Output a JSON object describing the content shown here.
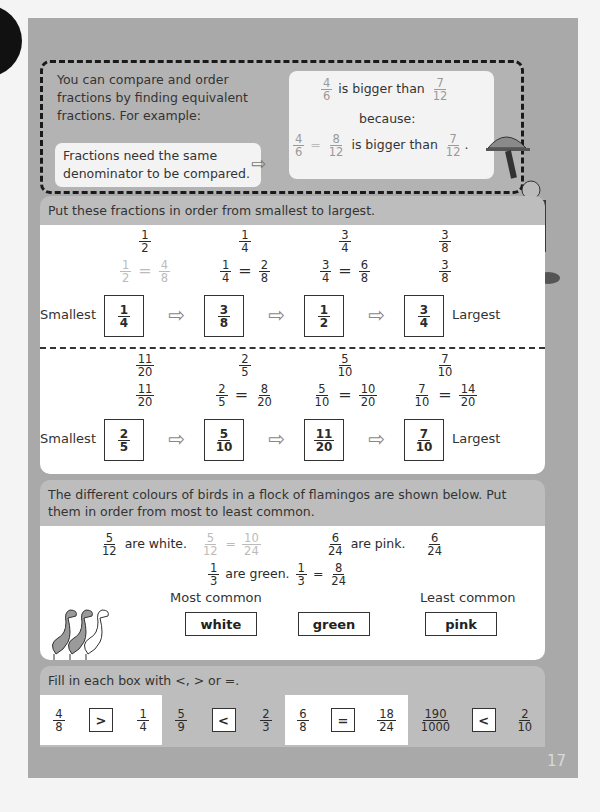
{
  "page_number": "17",
  "intro": {
    "text": "You can compare and order fractions by finding equivalent fractions.  For example:",
    "note": "Fractions need the same denominator to be compared.",
    "example": {
      "line1": {
        "a": {
          "n": "4",
          "d": "6"
        },
        "text": "is bigger than",
        "b": {
          "n": "7",
          "d": "12"
        }
      },
      "because": "because:",
      "line2": {
        "a": {
          "n": "4",
          "d": "6"
        },
        "eq": "=",
        "c": {
          "n": "8",
          "d": "12"
        },
        "text": "is bigger than",
        "b": {
          "n": "7",
          "d": "12"
        },
        "end": "."
      }
    }
  },
  "section1": {
    "header": "Put these fractions in order from smallest to largest.",
    "smallest_label": "Smallest",
    "largest_label": "Largest",
    "row1": {
      "given": [
        {
          "n": "1",
          "d": "2"
        },
        {
          "n": "1",
          "d": "4"
        },
        {
          "n": "3",
          "d": "4"
        },
        {
          "n": "3",
          "d": "8"
        }
      ],
      "working": [
        {
          "a": {
            "n": "1",
            "d": "2"
          },
          "eq": "=",
          "b": {
            "n": "4",
            "d": "8"
          }
        },
        {
          "a": {
            "n": "1",
            "d": "4"
          },
          "eq": "=",
          "b": {
            "n": "2",
            "d": "8"
          }
        },
        {
          "a": {
            "n": "3",
            "d": "4"
          },
          "eq": "=",
          "b": {
            "n": "6",
            "d": "8"
          }
        },
        {
          "a": {
            "n": "3",
            "d": "8"
          }
        }
      ],
      "answers": [
        {
          "n": "1",
          "d": "4"
        },
        {
          "n": "3",
          "d": "8"
        },
        {
          "n": "1",
          "d": "2"
        },
        {
          "n": "3",
          "d": "4"
        }
      ]
    },
    "row2": {
      "given": [
        {
          "n": "11",
          "d": "20"
        },
        {
          "n": "2",
          "d": "5"
        },
        {
          "n": "5",
          "d": "10"
        },
        {
          "n": "7",
          "d": "10"
        }
      ],
      "working": [
        {
          "a": {
            "n": "11",
            "d": "20"
          }
        },
        {
          "a": {
            "n": "2",
            "d": "5"
          },
          "eq": "=",
          "b": {
            "n": "8",
            "d": "20"
          }
        },
        {
          "a": {
            "n": "5",
            "d": "10"
          },
          "eq": "=",
          "b": {
            "n": "10",
            "d": "20"
          }
        },
        {
          "a": {
            "n": "7",
            "d": "10"
          },
          "eq": "=",
          "b": {
            "n": "14",
            "d": "20"
          }
        }
      ],
      "answers": [
        {
          "n": "2",
          "d": "5"
        },
        {
          "n": "5",
          "d": "10"
        },
        {
          "n": "11",
          "d": "20"
        },
        {
          "n": "7",
          "d": "10"
        }
      ]
    }
  },
  "section2": {
    "header": "The different colours of birds in a flock of flamingos are shown below.  Put them in order from most to least common.",
    "white": {
      "frac": {
        "n": "5",
        "d": "12"
      },
      "text": "are white.",
      "eq": "=",
      "equiv": {
        "n": "10",
        "d": "24"
      }
    },
    "pink": {
      "frac": {
        "n": "6",
        "d": "24"
      },
      "text": "are pink.",
      "equiv": {
        "n": "6",
        "d": "24"
      }
    },
    "green": {
      "frac": {
        "n": "1",
        "d": "3"
      },
      "text": "are green.",
      "eq": "=",
      "equiv": {
        "n": "8",
        "d": "24"
      }
    },
    "most_label": "Most common",
    "least_label": "Least common",
    "answers": [
      "white",
      "green",
      "pink"
    ]
  },
  "section3": {
    "header": "Fill in each box with <, > or =.",
    "items": [
      {
        "a": {
          "n": "4",
          "d": "8"
        },
        "sym": ">",
        "b": {
          "n": "1",
          "d": "4"
        }
      },
      {
        "a": {
          "n": "5",
          "d": "9"
        },
        "sym": "<",
        "b": {
          "n": "2",
          "d": "3"
        }
      },
      {
        "a": {
          "n": "6",
          "d": "8"
        },
        "sym": "=",
        "b": {
          "n": "18",
          "d": "24"
        }
      },
      {
        "a": {
          "n": "190",
          "d": "1000"
        },
        "sym": "<",
        "b": {
          "n": "2",
          "d": "10"
        }
      }
    ]
  }
}
